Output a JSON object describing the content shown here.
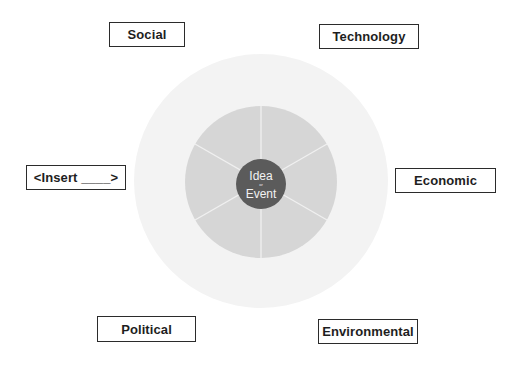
{
  "diagram": {
    "type": "concentric-wheel",
    "colors": {
      "outer_ring": "#f3f3f3",
      "middle_ring": "#d6d6d6",
      "center": "#5b5b5b",
      "divider": "#f0f0f0",
      "box_border": "#2b2b2b",
      "text": "#1e1e1e"
    },
    "center": {
      "line1": "Idea",
      "connector": "or",
      "line2": "Event"
    },
    "middle_ring": {
      "segments": 6
    },
    "labels": {
      "social": "Social",
      "technology": "Technology",
      "insert": "<Insert ____>",
      "economic": "Economic",
      "political": "Political",
      "environmental": "Environmental"
    }
  }
}
